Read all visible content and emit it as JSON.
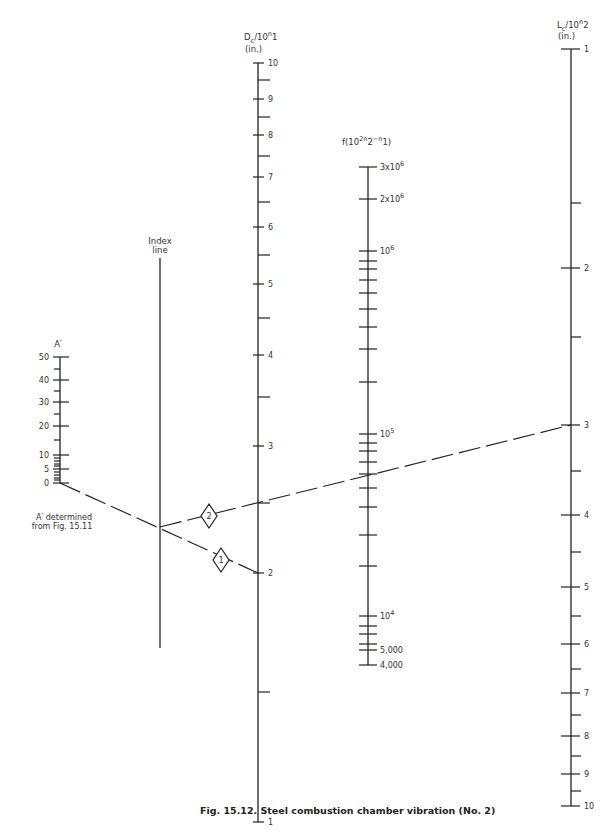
{
  "caption": "Fig. 15.12.   Steel combustion chamber vibration (No. 2)",
  "axes": {
    "A": {
      "title": "A′",
      "x": 60,
      "top": 357,
      "bottom": 483,
      "labeled_ticks": [
        {
          "label": "50",
          "y": 357
        },
        {
          "label": "40",
          "y": 380
        },
        {
          "label": "30",
          "y": 402
        },
        {
          "label": "20",
          "y": 426
        },
        {
          "label": "10",
          "y": 455
        },
        {
          "label": "5",
          "y": 469
        },
        {
          "label": "0",
          "y": 483
        }
      ],
      "minor_ticks": [
        369,
        391,
        414,
        440,
        458,
        461,
        464,
        466,
        472,
        475,
        478,
        480
      ]
    },
    "index": {
      "title_line1": "Index",
      "title_line2": "line",
      "x": 160,
      "top": 258,
      "bottom": 648
    },
    "D": {
      "title": "Dc/10^n1",
      "title_main": "D",
      "title_sub": "c",
      "title_rest": "/10",
      "title_sup": "n",
      "title_sup_end": "1",
      "unit": "(in.)",
      "x": 258,
      "top": 63,
      "bottom": 822,
      "labeled_ticks": [
        {
          "label": "10",
          "y": 63
        },
        {
          "label": "9",
          "y": 99
        },
        {
          "label": "8",
          "y": 135
        },
        {
          "label": "7",
          "y": 177
        },
        {
          "label": "6",
          "y": 227
        },
        {
          "label": "5",
          "y": 284
        },
        {
          "label": "4",
          "y": 355
        },
        {
          "label": "3",
          "y": 446
        },
        {
          "label": "2",
          "y": 573
        },
        {
          "label": "1",
          "y": 822
        }
      ],
      "minor_ticks": [
        80,
        117,
        156,
        202,
        255,
        318,
        397,
        503,
        692
      ]
    },
    "F": {
      "title": "f(10^2n2-n1)",
      "x": 368,
      "top": 167,
      "bottom": 665,
      "labeled_ticks": [
        {
          "label": "3x10",
          "sup": "6",
          "y": 167
        },
        {
          "label": "2x10",
          "sup": "6",
          "y": 199
        },
        {
          "label": "10",
          "sup": "6",
          "y": 251
        },
        {
          "label": "10",
          "sup": "5",
          "y": 434
        },
        {
          "label": "10",
          "sup": "4",
          "y": 616
        },
        {
          "label": "5,000",
          "sup": "",
          "y": 650
        },
        {
          "label": "4,000",
          "sup": "",
          "y": 665
        }
      ],
      "minor_ticks": [
        261,
        269,
        280,
        293,
        309,
        327,
        349,
        382,
        443,
        451,
        462,
        474,
        488,
        507,
        535,
        566,
        626,
        634,
        644
      ]
    },
    "L": {
      "title_main": "L",
      "title_sub": "c",
      "title_rest": "/10",
      "title_sup": "n",
      "title_sup_end": "2",
      "unit": "(in.)",
      "x": 571,
      "top": 49,
      "bottom": 806,
      "labeled_ticks": [
        {
          "label": "1",
          "y": 49
        },
        {
          "label": "2",
          "y": 268
        },
        {
          "label": "3",
          "y": 425
        },
        {
          "label": "4",
          "y": 515
        },
        {
          "label": "5",
          "y": 587
        },
        {
          "label": "6",
          "y": 644
        },
        {
          "label": "7",
          "y": 693
        },
        {
          "label": "8",
          "y": 736
        },
        {
          "label": "9",
          "y": 774
        },
        {
          "label": "10",
          "y": 806
        }
      ],
      "minor_ticks": [
        203,
        337,
        471,
        552,
        616,
        669,
        715,
        756,
        791
      ]
    }
  },
  "annotation": {
    "line1": "A′ determined",
    "line2": "from Fig. 15.11"
  },
  "solution_lines": [
    {
      "step": "1",
      "from": [
        60,
        483
      ],
      "to": [
        258,
        573
      ],
      "marker": [
        221,
        560
      ]
    },
    {
      "step": "2",
      "from": [
        160,
        527
      ],
      "to": [
        571,
        425
      ],
      "marker": [
        209,
        516
      ]
    }
  ]
}
